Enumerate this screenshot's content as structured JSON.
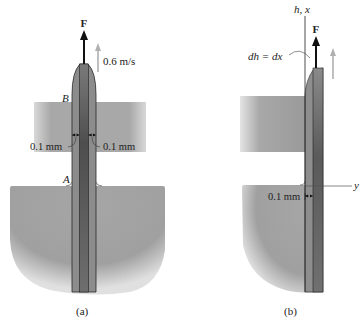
{
  "figure_a": {
    "caption": "(a)",
    "force_label": "F",
    "velocity_label": "0.6 m/s",
    "point_top_label": "B",
    "point_bottom_label": "A",
    "gap_left_label": "0.1 mm",
    "gap_right_label": "0.1 mm"
  },
  "figure_b": {
    "caption": "(b)",
    "force_label": "F",
    "vertical_axis_label": "h, x",
    "horizontal_axis_label": "y",
    "differential_label": "dh = dx",
    "gap_label": "0.1 mm"
  },
  "colors": {
    "fluid": "#a6a6a6",
    "fluid_dark": "#8c8c8c",
    "plate": "#8a8a8a",
    "plate_core": "#5e5e5e",
    "arrow": "#111111",
    "velocity_arrow": "#b0b0b0",
    "background": "#ffffff"
  }
}
